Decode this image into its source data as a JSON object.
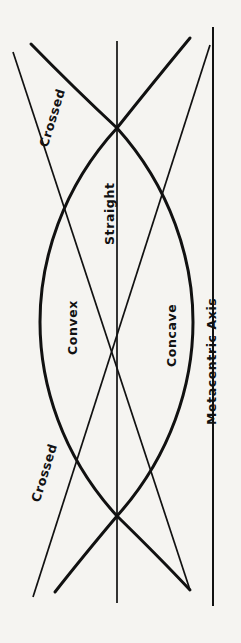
{
  "figure": {
    "background_color": "#f5f4f1",
    "stroke_color": "#111111",
    "width": 241,
    "height": 643
  },
  "labels": {
    "crossed_top": "Crossed",
    "crossed_bottom": "Crossed",
    "straight": "Straight",
    "convex": "Convex",
    "concave": "Concave",
    "metacentric_axis": "Metacentric Axis"
  },
  "curves": {
    "convex": {
      "name": "Convex",
      "kind": "thick-curve",
      "bulge_direction": "left",
      "stroke_width": 3.0,
      "extreme_x": 40,
      "extreme_y": 322
    },
    "concave": {
      "name": "Concave",
      "kind": "thick-curve",
      "bulge_direction": "right",
      "stroke_width": 3.0,
      "extreme_x": 193,
      "extreme_y": 322
    },
    "straight": {
      "name": "Straight",
      "kind": "thin-vertical-line",
      "stroke_width": 1.6,
      "x": 117
    },
    "crossed": {
      "name": "Crossed",
      "kind": "thin-diagonal-lines",
      "stroke_width": 1.6,
      "count": 2
    },
    "metacentric_axis": {
      "name": "Metacentric Axis",
      "kind": "thin-vertical-line",
      "stroke_width": 1.8,
      "x": 213
    }
  },
  "nodes": [
    {
      "name": "upper-node",
      "x": 117,
      "y": 128
    },
    {
      "name": "center-node",
      "x": 117,
      "y": 322
    },
    {
      "name": "lower-node",
      "x": 117,
      "y": 516
    }
  ]
}
